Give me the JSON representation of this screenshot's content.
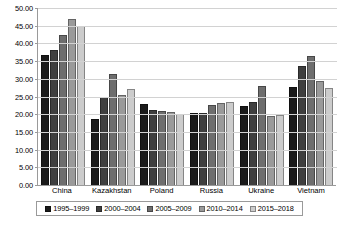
{
  "chart_data": {
    "type": "bar",
    "title": "",
    "subtitle": "",
    "xlabel": "",
    "ylabel": "",
    "ylim": [
      0,
      50
    ],
    "ytick_step": 5,
    "ytick_labels": [
      "0.00",
      "5.00",
      "10.00",
      "15.00",
      "20.00",
      "25.00",
      "30.00",
      "35.00",
      "40.00",
      "45.00",
      "50.00"
    ],
    "grid": true,
    "legend_position": "bottom",
    "categories": [
      "China",
      "Kazakhstan",
      "Poland",
      "Russia",
      "Ukraine",
      "Vietnam"
    ],
    "series": [
      {
        "name": "1995–1999",
        "color": "#1a1a1a",
        "values": [
          36.8,
          18.7,
          22.8,
          20.4,
          22.3,
          27.8
        ]
      },
      {
        "name": "2000–2004",
        "color": "#3f3f3f",
        "values": [
          38.2,
          24.8,
          21.2,
          20.4,
          23.5,
          33.5
        ]
      },
      {
        "name": "2005–2009",
        "color": "#6e6e6e",
        "values": [
          42.5,
          31.3,
          21.0,
          22.6,
          28.0,
          36.5
        ]
      },
      {
        "name": "2010–2014",
        "color": "#9a9a9a",
        "values": [
          47.0,
          25.3,
          20.5,
          23.2,
          19.5,
          29.5
        ]
      },
      {
        "name": "2015–2018",
        "color": "#cccccc",
        "values": [
          45.0,
          27.2,
          20.2,
          23.4,
          19.8,
          27.5
        ]
      }
    ]
  }
}
